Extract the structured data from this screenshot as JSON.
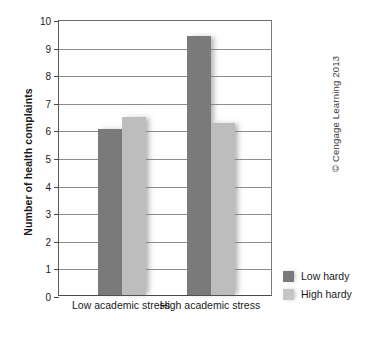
{
  "chart_data": {
    "type": "bar",
    "title": "",
    "xlabel": "",
    "ylabel": "Number of health complaints",
    "categories": [
      "Low academic stress",
      "High academic stress"
    ],
    "series": [
      {
        "name": "Low hardy",
        "values": [
          6.0,
          9.4
        ],
        "color": "#7a7a7a"
      },
      {
        "name": "High hardy",
        "values": [
          6.45,
          6.25
        ],
        "color": "#bdbdbd"
      }
    ],
    "ylim": [
      0,
      10
    ],
    "ytick_labels": [
      "10",
      "9",
      "8",
      "7",
      "6",
      "5",
      "4",
      "3",
      "2",
      "1",
      "0"
    ],
    "ytick_values": [
      10,
      9,
      8,
      7,
      6,
      5,
      4,
      3,
      2,
      1,
      0
    ],
    "grid": true,
    "legend_position": "bottom-right"
  },
  "legend": {
    "items": [
      {
        "label": "Low hardy",
        "swatch": "dark"
      },
      {
        "label": "High hardy",
        "swatch": "light"
      }
    ]
  },
  "footer": {
    "copyright": "© Cengage Learning 2013"
  }
}
